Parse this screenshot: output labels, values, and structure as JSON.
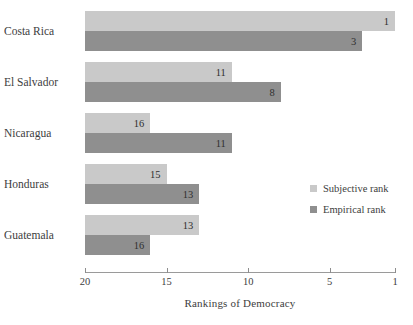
{
  "chart_data": {
    "type": "bar",
    "orientation": "horizontal",
    "title": "",
    "xlabel": "Rankings of Democracy",
    "ylabel": "",
    "categories": [
      "Costa Rica",
      "El Salvador",
      "Nicaragua",
      "Honduras",
      "Guatemala"
    ],
    "series": [
      {
        "name": "Subjective rank",
        "color": "#c9c9c9",
        "values": [
          1,
          11,
          16,
          15,
          13
        ]
      },
      {
        "name": "Empirical rank",
        "color": "#8f8f8f",
        "values": [
          3,
          8,
          11,
          13,
          16
        ]
      }
    ],
    "xticks": [
      20,
      15,
      10,
      5,
      1
    ],
    "xtick_labels": [
      "20",
      "15",
      "10",
      "5",
      "1"
    ],
    "xlim": [
      20,
      1
    ],
    "x_axis_reversed": true,
    "grid": false,
    "legend_position": "middle-right",
    "data_labels": true
  },
  "axis": {
    "title": "Rankings of Democracy",
    "ticks": [
      "20",
      "15",
      "10",
      "5",
      "1"
    ]
  },
  "legend": {
    "items": [
      {
        "label": "Subjective rank",
        "swatch": "subjective"
      },
      {
        "label": "Empirical rank",
        "swatch": "empirical"
      }
    ]
  },
  "clipped_top_text": ""
}
